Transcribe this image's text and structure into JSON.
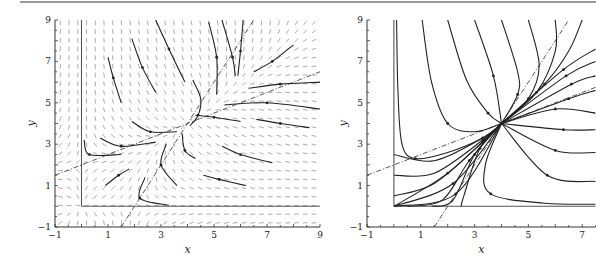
{
  "chart_data": [
    {
      "type": "line",
      "title": "",
      "subtitle": "Direction field with sample trajectories",
      "xlabel": "x",
      "ylabel": "y",
      "xlim": [
        -1,
        9
      ],
      "ylim": [
        -1,
        9
      ],
      "xticks": [
        "-1",
        "1",
        "3",
        "5",
        "7",
        "9"
      ],
      "yticks": [
        "-1",
        "1",
        "3",
        "5",
        "7",
        "9"
      ],
      "grid": false,
      "legend": null,
      "direction_field": true,
      "equilibrium": [
        4,
        4
      ],
      "isoclines": [
        {
          "name": "dashed line 1",
          "equation": "y = 0.5x + 2",
          "points": [
            [
              -1,
              1.5
            ],
            [
              9,
              6.5
            ]
          ]
        },
        {
          "name": "dashed line 2",
          "equation": "y = 2x - 4",
          "points": [
            [
              1.5,
              -1
            ],
            [
              6.5,
              9
            ]
          ]
        }
      ],
      "boundary_lines": [
        {
          "name": "x = 0",
          "points": [
            [
              0,
              0
            ],
            [
              0,
              9
            ]
          ]
        },
        {
          "name": "y = 0",
          "points": [
            [
              0,
              0
            ],
            [
              9,
              0
            ]
          ]
        }
      ],
      "series": [
        {
          "name": "traj-1",
          "points": [
            [
              1.0,
              7.2
            ],
            [
              1.2,
              6.2
            ],
            [
              1.5,
              5.0
            ]
          ]
        },
        {
          "name": "traj-2",
          "points": [
            [
              1.9,
              8.1
            ],
            [
              2.3,
              6.7
            ],
            [
              2.8,
              5.5
            ]
          ]
        },
        {
          "name": "traj-3",
          "points": [
            [
              2.8,
              9.0
            ],
            [
              3.3,
              7.6
            ],
            [
              3.9,
              6.0
            ]
          ]
        },
        {
          "name": "traj-4",
          "points": [
            [
              5.3,
              9.0
            ],
            [
              5.7,
              7.2
            ],
            [
              5.8,
              6.3
            ]
          ]
        },
        {
          "name": "traj-5",
          "points": [
            [
              4.8,
              8.9
            ],
            [
              5.1,
              7.2
            ],
            [
              5.1,
              5.4
            ]
          ]
        },
        {
          "name": "traj-6",
          "points": [
            [
              6.1,
              9.0
            ],
            [
              6.0,
              7.5
            ],
            [
              5.9,
              6.3
            ]
          ]
        },
        {
          "name": "traj-7",
          "points": [
            [
              8.0,
              7.8
            ],
            [
              7.2,
              7.0
            ],
            [
              6.5,
              6.5
            ]
          ]
        },
        {
          "name": "traj-8",
          "points": [
            [
              9.0,
              6.0
            ],
            [
              7.5,
              5.9
            ],
            [
              6.3,
              5.7
            ]
          ]
        },
        {
          "name": "traj-9",
          "points": [
            [
              9.0,
              4.7
            ],
            [
              7.0,
              5.0
            ],
            [
              5.4,
              4.9
            ]
          ]
        },
        {
          "name": "traj-10",
          "points": [
            [
              8.6,
              3.8
            ],
            [
              7.5,
              4.0
            ],
            [
              6.6,
              4.2
            ]
          ]
        },
        {
          "name": "traj-11",
          "points": [
            [
              7.2,
              2.1
            ],
            [
              6.0,
              2.5
            ],
            [
              5.3,
              2.9
            ]
          ]
        },
        {
          "name": "traj-12",
          "points": [
            [
              6.2,
              1.0
            ],
            [
              5.2,
              1.3
            ],
            [
              4.6,
              1.5
            ]
          ]
        },
        {
          "name": "traj-13",
          "points": [
            [
              4.2,
              6.1
            ],
            [
              4.5,
              5.2
            ],
            [
              4.4,
              4.4
            ],
            [
              4.1,
              3.9
            ]
          ]
        },
        {
          "name": "traj-14",
          "points": [
            [
              1.9,
              4.1
            ],
            [
              2.6,
              3.6
            ],
            [
              3.6,
              3.6
            ]
          ]
        },
        {
          "name": "traj-15",
          "points": [
            [
              0.7,
              3.3
            ],
            [
              1.5,
              2.9
            ],
            [
              2.8,
              3.1
            ]
          ]
        },
        {
          "name": "traj-16",
          "points": [
            [
              0.1,
              3.2
            ],
            [
              0.3,
              2.5
            ],
            [
              1.5,
              2.5
            ]
          ]
        },
        {
          "name": "traj-17",
          "points": [
            [
              0.9,
              1.0
            ],
            [
              1.4,
              1.5
            ],
            [
              1.8,
              1.8
            ]
          ]
        },
        {
          "name": "traj-18",
          "points": [
            [
              3.8,
              3.5
            ],
            [
              3.9,
              2.7
            ],
            [
              4.3,
              2.3
            ]
          ]
        },
        {
          "name": "traj-19",
          "points": [
            [
              3.2,
              3.0
            ],
            [
              3.0,
              2.0
            ],
            [
              3.6,
              1.0
            ]
          ]
        },
        {
          "name": "traj-20",
          "points": [
            [
              2.4,
              1.4
            ],
            [
              2.2,
              0.4
            ],
            [
              3.3,
              0.05
            ]
          ]
        },
        {
          "name": "traj-21",
          "points": [
            [
              4.3,
              4.4
            ],
            [
              5.0,
              4.3
            ],
            [
              6.0,
              4.1
            ]
          ]
        }
      ]
    },
    {
      "type": "line",
      "title": "",
      "subtitle": "Phase portrait",
      "xlabel": "x",
      "ylabel": "y",
      "xlim": [
        -1,
        7.5
      ],
      "ylim": [
        -1,
        9
      ],
      "xticks": [
        "-1",
        "1",
        "3",
        "5",
        "7"
      ],
      "yticks": [
        "-1",
        "1",
        "3",
        "5",
        "7",
        "9"
      ],
      "grid": false,
      "legend": null,
      "equilibrium": [
        4,
        4
      ],
      "isoclines": [
        {
          "name": "dashed line 1",
          "equation": "y = 0.5x + 2",
          "points": [
            [
              -1,
              1.5
            ],
            [
              7.5,
              5.75
            ]
          ]
        },
        {
          "name": "dashed line 2",
          "equation": "y = 2x - 4",
          "points": [
            [
              1.5,
              -1
            ],
            [
              6.5,
              9
            ]
          ]
        }
      ],
      "boundary_lines": [
        {
          "name": "x = 0",
          "points": [
            [
              0,
              0
            ],
            [
              0,
              9
            ]
          ]
        },
        {
          "name": "y = 0",
          "points": [
            [
              0,
              0
            ],
            [
              7.5,
              0
            ]
          ]
        }
      ],
      "series": [
        {
          "name": "from-top-1",
          "points": [
            [
              0.1,
              9
            ],
            [
              0.15,
              5.6
            ],
            [
              0.3,
              3.0
            ],
            [
              0.8,
              2.3
            ],
            [
              2.0,
              2.6
            ],
            [
              3.3,
              3.3
            ],
            [
              4,
              4
            ]
          ]
        },
        {
          "name": "from-top-2",
          "points": [
            [
              1.05,
              9
            ],
            [
              1.4,
              6.0
            ],
            [
              2.0,
              4.0
            ],
            [
              3.0,
              3.6
            ],
            [
              4,
              4
            ]
          ]
        },
        {
          "name": "from-top-3",
          "points": [
            [
              2.0,
              9
            ],
            [
              2.7,
              6.1
            ],
            [
              3.5,
              4.5
            ],
            [
              4,
              4
            ]
          ]
        },
        {
          "name": "from-top-4",
          "points": [
            [
              3.0,
              9
            ],
            [
              3.7,
              6.3
            ],
            [
              4,
              4
            ]
          ]
        },
        {
          "name": "from-top-5",
          "points": [
            [
              4.0,
              9
            ],
            [
              4.6,
              6.5
            ],
            [
              4.6,
              5.4
            ],
            [
              4,
              4
            ]
          ]
        },
        {
          "name": "from-top-6",
          "points": [
            [
              5.0,
              9
            ],
            [
              5.4,
              6.8
            ],
            [
              5.0,
              5.2
            ],
            [
              4,
              4
            ]
          ]
        },
        {
          "name": "from-top-7",
          "points": [
            [
              6.0,
              9
            ],
            [
              6.0,
              7.5
            ],
            [
              5.3,
              5.5
            ],
            [
              4,
              4
            ]
          ]
        },
        {
          "name": "from-top-8",
          "points": [
            [
              7.0,
              9
            ],
            [
              6.5,
              7.5
            ],
            [
              5.6,
              5.9
            ],
            [
              4,
              4
            ]
          ]
        },
        {
          "name": "from-right-1",
          "points": [
            [
              7.5,
              7.6
            ],
            [
              6.3,
              6.6
            ],
            [
              4,
              4
            ]
          ]
        },
        {
          "name": "from-right-2",
          "points": [
            [
              7.5,
              7.0
            ],
            [
              6.4,
              6.3
            ],
            [
              4,
              4
            ]
          ]
        },
        {
          "name": "from-right-3",
          "points": [
            [
              7.5,
              6.3
            ],
            [
              6.6,
              5.9
            ],
            [
              4,
              4
            ]
          ]
        },
        {
          "name": "from-right-4",
          "points": [
            [
              7.5,
              5.6
            ],
            [
              6.5,
              5.2
            ],
            [
              4,
              4
            ]
          ]
        },
        {
          "name": "from-right-5",
          "points": [
            [
              7.5,
              4.5
            ],
            [
              6.0,
              4.7
            ],
            [
              4,
              4
            ]
          ]
        },
        {
          "name": "from-right-6",
          "points": [
            [
              7.5,
              3.7
            ],
            [
              6.3,
              3.7
            ],
            [
              4,
              4
            ]
          ]
        },
        {
          "name": "from-right-7",
          "points": [
            [
              7.5,
              2.6
            ],
            [
              6.0,
              2.7
            ],
            [
              4,
              4
            ]
          ]
        },
        {
          "name": "from-right-8",
          "points": [
            [
              7.5,
              1.2
            ],
            [
              5.7,
              1.5
            ],
            [
              4,
              4
            ]
          ]
        },
        {
          "name": "from-right-9",
          "points": [
            [
              7.5,
              0.1
            ],
            [
              5.6,
              0.15
            ],
            [
              3.6,
              0.6
            ],
            [
              3.4,
              2.0
            ],
            [
              4,
              4
            ]
          ]
        },
        {
          "name": "from-left-1",
          "points": [
            [
              0,
              2.5
            ],
            [
              1.5,
              2.2
            ],
            [
              3.3,
              3.3
            ],
            [
              4,
              4
            ]
          ]
        },
        {
          "name": "from-left-2",
          "points": [
            [
              0,
              1.5
            ],
            [
              1.5,
              1.6
            ],
            [
              3.3,
              3.2
            ],
            [
              4,
              4
            ]
          ]
        },
        {
          "name": "from-left-3",
          "points": [
            [
              0,
              0.5
            ],
            [
              1.5,
              1.1
            ],
            [
              3.3,
              3.1
            ],
            [
              4,
              4
            ]
          ]
        },
        {
          "name": "from-origin-1",
          "points": [
            [
              0,
              0
            ],
            [
              2.0,
              1.6
            ],
            [
              4,
              4
            ]
          ]
        },
        {
          "name": "from-origin-2",
          "points": [
            [
              0,
              0
            ],
            [
              2.2,
              1.1
            ],
            [
              4,
              4
            ]
          ]
        },
        {
          "name": "from-origin-3",
          "points": [
            [
              0,
              0
            ],
            [
              2.3,
              0.6
            ],
            [
              4,
              4
            ]
          ]
        },
        {
          "name": "from-bottom-1",
          "points": [
            [
              0.5,
              0
            ],
            [
              1.8,
              0.3
            ],
            [
              2.8,
              2.2
            ],
            [
              4,
              4
            ]
          ]
        },
        {
          "name": "from-bottom-2",
          "points": [
            [
              1.4,
              0
            ],
            [
              2.2,
              0.3
            ],
            [
              3.0,
              2.5
            ],
            [
              4,
              4
            ]
          ]
        },
        {
          "name": "from-bottom-3",
          "points": [
            [
              2.5,
              0
            ],
            [
              2.6,
              0.5
            ],
            [
              3.2,
              2.8
            ],
            [
              4,
              4
            ]
          ]
        }
      ]
    }
  ],
  "axes_labels": {
    "left": {
      "x": "x",
      "y": "y"
    },
    "right": {
      "x": "x",
      "y": "y"
    }
  }
}
